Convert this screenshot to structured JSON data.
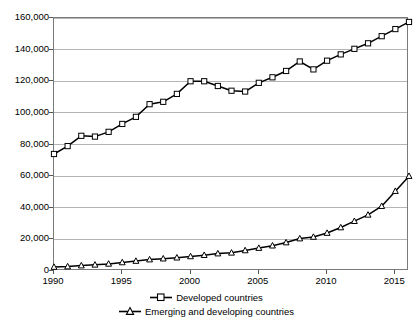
{
  "chart_data": {
    "type": "line",
    "title": "",
    "subtitle": "",
    "xlabel": "",
    "ylabel": "",
    "xlim": [
      1990,
      2016
    ],
    "ylim": [
      0,
      160000
    ],
    "grid": true,
    "legend_position": "bottom",
    "x": [
      1990,
      1991,
      1992,
      1993,
      1994,
      1995,
      1996,
      1997,
      1998,
      1999,
      2000,
      2001,
      2002,
      2003,
      2004,
      2005,
      2006,
      2007,
      2008,
      2009,
      2010,
      2011,
      2012,
      2013,
      2014,
      2015,
      2016
    ],
    "xticks": [
      "1990",
      "1995",
      "2000",
      "2005",
      "2010",
      "2015"
    ],
    "yticks": [
      "0",
      "20,000",
      "40,000",
      "60,000",
      "80,000",
      "100,000",
      "120,000",
      "140,000",
      "160,000"
    ],
    "series": [
      {
        "name": "Developed countries",
        "marker": "open-square",
        "values": [
          74000,
          79000,
          85500,
          85000,
          88000,
          93000,
          97500,
          105500,
          107000,
          112000,
          120000,
          120000,
          117000,
          114000,
          113500,
          119000,
          122500,
          126500,
          132500,
          127500,
          133000,
          137000,
          140500,
          144000,
          148500,
          153000,
          157500
        ]
      },
      {
        "name": "Emerging and developing countries",
        "marker": "open-triangle",
        "values": [
          2500,
          2800,
          3400,
          3900,
          4500,
          5400,
          6300,
          7200,
          7800,
          8400,
          9200,
          10000,
          11000,
          11500,
          13000,
          14500,
          16000,
          18000,
          20500,
          21500,
          24000,
          27500,
          31500,
          35500,
          41000,
          50500,
          60000
        ]
      }
    ]
  },
  "legend": {
    "items": [
      {
        "label": "Developed countries",
        "marker": "open-square"
      },
      {
        "label": "Emerging and developing countries",
        "marker": "open-triangle"
      }
    ]
  },
  "colors": {
    "series_line": "#000000",
    "marker_fill": "#ffffff",
    "gridline": "#b5b5b5",
    "axis": "#7a7a7a",
    "background": "#ffffff"
  }
}
